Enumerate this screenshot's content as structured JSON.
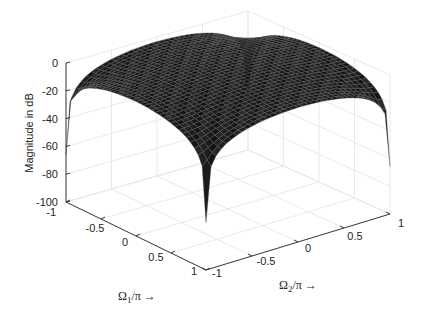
{
  "chart_data": {
    "type": "surface3d",
    "title": "",
    "xlabel": "Ω1/π →",
    "xlabel_main": "Ω",
    "xlabel_sub": "1",
    "xlabel_rest": "/π →",
    "ylabel": "Ω2/π →",
    "ylabel_main": "Ω",
    "ylabel_sub": "2",
    "ylabel_rest": "/π →",
    "zlabel": "Magnitude in dB",
    "xlim": [
      -1,
      1
    ],
    "ylim": [
      -1,
      1
    ],
    "zlim": [
      -100,
      0
    ],
    "x_ticks": [
      -1,
      -0.5,
      0,
      0.5,
      1
    ],
    "x_tick_labels": [
      "-1",
      "-0.5",
      "0",
      "0.5",
      "1"
    ],
    "y_ticks": [
      -1,
      -0.5,
      0,
      0.5,
      1
    ],
    "y_tick_labels": [
      "-1",
      "-0.5",
      "0",
      "0.5",
      "1"
    ],
    "z_ticks": [
      0,
      -20,
      -40,
      -60,
      -80,
      -100
    ],
    "z_tick_labels": [
      "0",
      "-20",
      "-40",
      "-60",
      "-80",
      "-100"
    ],
    "grid": true,
    "surface_description": "2-D lowpass magnitude response; peak ≈ 0 dB at (0,0), ≈ -75 dB at edge midpoints (Ω1=±1 or Ω2=±1), ≈ -100 dB at corners",
    "surface_samples": {
      "x": [
        -1,
        -0.5,
        0,
        0.5,
        1
      ],
      "y": [
        -1,
        -0.5,
        0,
        0.5,
        1
      ],
      "z": [
        [
          -100,
          -85,
          -75,
          -85,
          -100
        ],
        [
          -85,
          -20,
          -8,
          -20,
          -85
        ],
        [
          -75,
          -8,
          0,
          -8,
          -75
        ],
        [
          -85,
          -20,
          -8,
          -20,
          -85
        ],
        [
          -100,
          -85,
          -75,
          -85,
          -100
        ]
      ]
    },
    "colors": {
      "surface": "#1a1a1a",
      "mesh": "#5a5a5a",
      "axis": "#262626",
      "grid": "#e3e3e3"
    }
  }
}
